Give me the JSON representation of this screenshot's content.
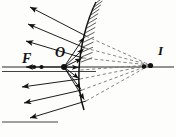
{
  "figure": {
    "kind": "optics-ray-diagram",
    "background_color": "#fdfdfc",
    "ink_color": "#111111",
    "dash_color": "#8c8c8c",
    "width": 176,
    "height": 137
  },
  "labels": {
    "focal_point": "F",
    "object_point": "O",
    "image_point": "I"
  },
  "points": {
    "F": {
      "x": 41,
      "y": 67
    },
    "O": {
      "x": 64,
      "y": 67
    },
    "I": {
      "x": 152,
      "y": 66
    },
    "F_label": {
      "x": 22,
      "y": 63
    },
    "O_label": {
      "x": 56,
      "y": 56
    },
    "I_label": {
      "x": 159,
      "y": 54
    }
  },
  "mirror": {
    "type": "convex",
    "hatched": true,
    "hatch_count": 14,
    "path": "M 96 2 C 86 22 80 48 79 70 C 78 86 80 98 84 110"
  },
  "axis": {
    "label": "principal-axis",
    "y": 67,
    "x_start": 2,
    "x_end": 174
  },
  "incident_rays": [
    {
      "to_x": 86,
      "to_y": 36
    },
    {
      "to_x": 85,
      "to_y": 48
    },
    {
      "to_x": 83,
      "to_y": 58
    },
    {
      "to_x": 80,
      "to_y": 68
    },
    {
      "to_x": 80,
      "to_y": 79
    },
    {
      "to_x": 82,
      "to_y": 90
    },
    {
      "to_x": 86,
      "to_y": 101
    }
  ],
  "reflected_rays": [
    {
      "from_x": 86,
      "from_y": 36,
      "to_x": 28,
      "to_y": 6
    },
    {
      "from_x": 85,
      "from_y": 48,
      "to_x": 26,
      "to_y": 23
    },
    {
      "from_x": 83,
      "from_y": 58,
      "to_x": 24,
      "to_y": 40
    },
    {
      "from_x": 80,
      "from_y": 79,
      "to_x": 20,
      "to_y": 86
    },
    {
      "from_x": 82,
      "from_y": 90,
      "to_x": 22,
      "to_y": 102
    },
    {
      "from_x": 86,
      "from_y": 101,
      "to_x": 28,
      "to_y": 117
    }
  ],
  "virtual_rays": [
    {
      "from_x": 86,
      "from_y": 36,
      "to_x": 150,
      "to_y": 65
    },
    {
      "from_x": 85,
      "from_y": 48,
      "to_x": 150,
      "to_y": 65
    },
    {
      "from_x": 83,
      "from_y": 58,
      "to_x": 150,
      "to_y": 65
    },
    {
      "from_x": 80,
      "from_y": 79,
      "to_x": 150,
      "to_y": 65
    },
    {
      "from_x": 82,
      "from_y": 90,
      "to_x": 150,
      "to_y": 65
    },
    {
      "from_x": 86,
      "from_y": 101,
      "to_x": 150,
      "to_y": 65
    }
  ],
  "focal_ray": {
    "from_x": 62,
    "from_y": 67,
    "to_x": 24,
    "to_y": 67
  }
}
